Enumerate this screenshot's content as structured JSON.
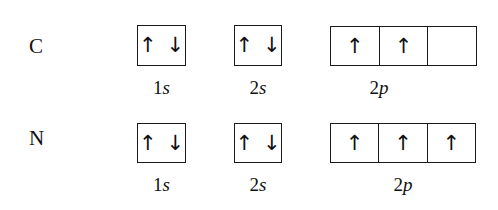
{
  "diagram": {
    "rows": [
      {
        "element": "C",
        "orbitals": [
          {
            "label_num": "1",
            "label_sub": "s",
            "boxes": [
              [
                "↑",
                "↓"
              ]
            ]
          },
          {
            "label_num": "2",
            "label_sub": "s",
            "boxes": [
              [
                "↑",
                "↓"
              ]
            ]
          },
          {
            "label_num": "2",
            "label_sub": "p",
            "boxes": [
              [
                "↑"
              ],
              [
                "↑"
              ],
              []
            ]
          }
        ]
      },
      {
        "element": "N",
        "orbitals": [
          {
            "label_num": "1",
            "label_sub": "s",
            "boxes": [
              [
                "↑",
                "↓"
              ]
            ]
          },
          {
            "label_num": "2",
            "label_sub": "s",
            "boxes": [
              [
                "↑",
                "↓"
              ]
            ]
          },
          {
            "label_num": "2",
            "label_sub": "p",
            "boxes": [
              [
                "↑"
              ],
              [
                "↑"
              ],
              [
                "↑"
              ]
            ]
          }
        ]
      }
    ]
  },
  "rows": [
    {
      "element": "C",
      "o1s": {
        "num": "1",
        "sub": "s",
        "e1": "↑",
        "e2": "↓"
      },
      "o2s": {
        "num": "2",
        "sub": "s",
        "e1": "↑",
        "e2": "↓"
      },
      "o2p": {
        "num": "2",
        "sub": "p",
        "b1": "↑",
        "b2": "↑",
        "b3": ""
      }
    },
    {
      "element": "N",
      "o1s": {
        "num": "1",
        "sub": "s",
        "e1": "↑",
        "e2": "↓"
      },
      "o2s": {
        "num": "2",
        "sub": "s",
        "e1": "↑",
        "e2": "↓"
      },
      "o2p": {
        "num": "2",
        "sub": "p",
        "b1": "↑",
        "b2": "↑",
        "b3": "↑"
      }
    }
  ]
}
